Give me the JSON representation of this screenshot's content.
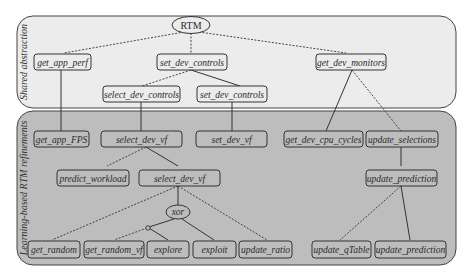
{
  "panels": {
    "top": {
      "label": "Shared abstraction",
      "fill": "#ececec"
    },
    "bottom": {
      "label": "Learning-based RTM refinements",
      "fill": "#bdbdbd"
    }
  },
  "nodes": {
    "rtm": "RTM",
    "get_app_perf": "get_app_perf",
    "set_dev_controls": "set_dev_controls",
    "get_dev_monitors": "get_dev_monitors",
    "select_dev_controls": "select_dev_controls",
    "set_dev_controls_2": "set_dev_controls",
    "get_app_FPS": "get_app_FPS",
    "select_dev_vf": "select_dev_vf",
    "set_dev_vf": "set_dev_vf",
    "get_dev_cpu_cycles": "get_dev_cpu_cycles",
    "update_selections": "update_selections",
    "predict_workload": "predict_workload",
    "select_dev_vf_2": "select_dev_vf",
    "update_prediction": "update_prediction",
    "xor": "xor",
    "get_random": "get_random",
    "get_random_vf": "get_random_vf",
    "explore": "explore",
    "exploit": "exploit",
    "update_ratio": "update_ratio",
    "update_qTable": "update_qTable",
    "update_prediction_2": "update_prediction"
  }
}
